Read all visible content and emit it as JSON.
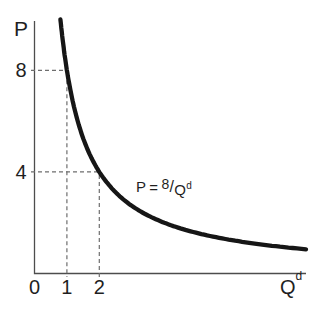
{
  "chart_data": {
    "type": "line",
    "equation": "P = 8/Q^d",
    "coefficient": 8,
    "q_domain": [
      0.8,
      8.38
    ],
    "xlim": [
      0,
      8.4
    ],
    "ylim": [
      0,
      10
    ],
    "grid": false,
    "x_axis": {
      "label_base": "Q",
      "label_sup": "d",
      "ticks": [
        {
          "value": 0,
          "label": "0"
        },
        {
          "value": 1,
          "label": "1"
        },
        {
          "value": 2,
          "label": "2"
        }
      ]
    },
    "y_axis": {
      "label": "P",
      "ticks": [
        {
          "value": 4,
          "label": "4"
        },
        {
          "value": 8,
          "label": "8"
        }
      ]
    },
    "points_highlighted": [
      {
        "q": 1,
        "p": 8
      },
      {
        "q": 2,
        "p": 4
      }
    ],
    "annotation": {
      "p": "P",
      "equals": "=",
      "numerator": "8",
      "slash": "/",
      "q_base": "Q",
      "q_sup": "d"
    },
    "colors": {
      "curve": "#161616",
      "axis": "#4d4d4d",
      "guide": "#6e6e6e",
      "text": "#1f1f1f",
      "background": "#ffffff"
    }
  }
}
